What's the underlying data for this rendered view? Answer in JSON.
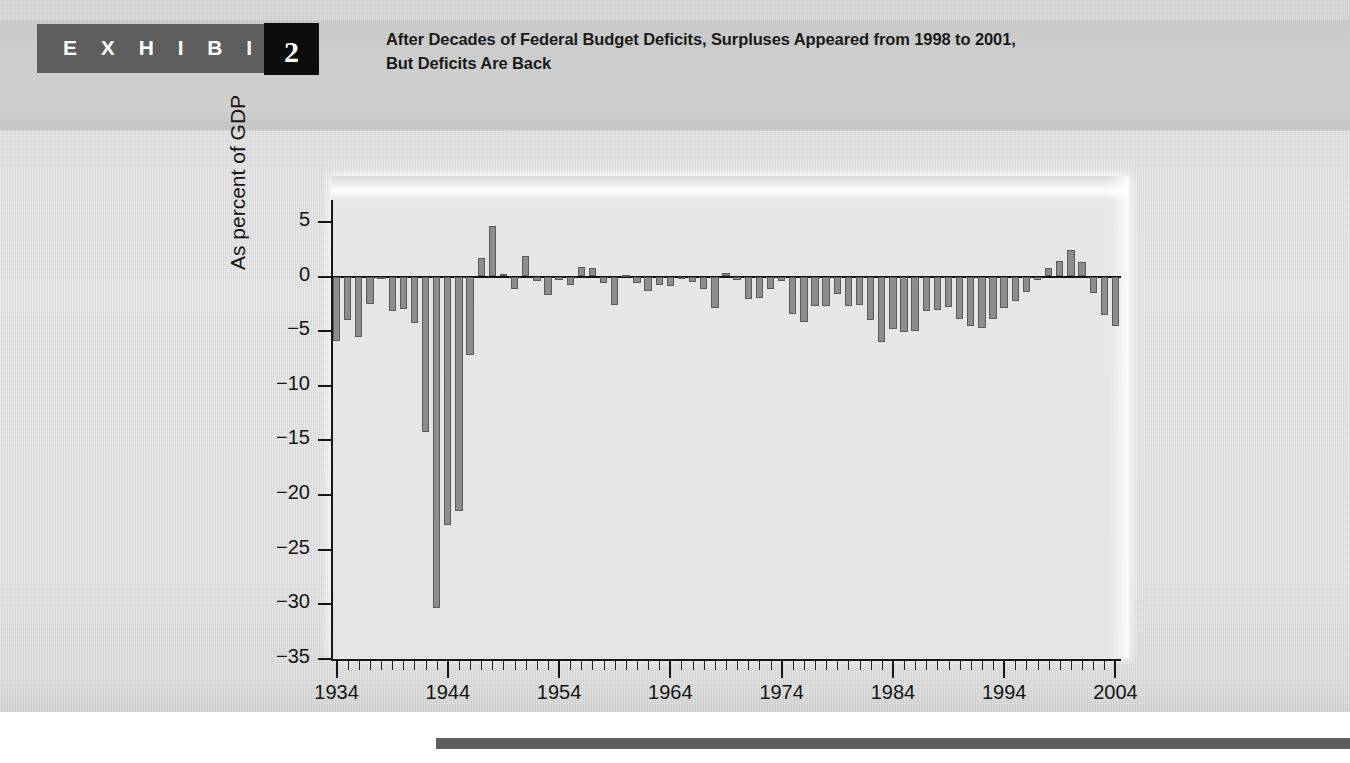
{
  "exhibit": {
    "label": "E X H I B I T",
    "number": "2",
    "title_line1": "After Decades of Federal Budget Deficits, Surpluses Appeared from 1998 to 2001,",
    "title_line2": "But Deficits Are Back"
  },
  "colors": {
    "header_band": "#cfcfcf",
    "exhibit_tab": "#5e5e5e",
    "exhibit_number_box": "#0d0d0d",
    "page_background": "#e0e0e0",
    "panel_background": "#e7e7e7",
    "bar_fill": "#8d8d8d",
    "bar_stroke": "#5a5a5a",
    "axis": "#161616",
    "bottom_rule": "#5d5d5d"
  },
  "chart_data": {
    "type": "bar",
    "title": "After Decades of Federal Budget Deficits, Surpluses Appeared from 1998 to 2001, But Deficits Are Back",
    "xlabel": "",
    "ylabel": "As percent of GDP",
    "ylim": [
      -35,
      7
    ],
    "xlim": [
      1933.5,
      2004.5
    ],
    "grid": false,
    "legend": null,
    "ytick_labels": [
      "5",
      "0",
      "−5",
      "−10",
      "−15",
      "−20",
      "−25",
      "−30",
      "−35"
    ],
    "ytick_values": [
      5,
      0,
      -5,
      -10,
      -15,
      -20,
      -25,
      -30,
      -35
    ],
    "xtick_labels": [
      "1934",
      "1944",
      "1954",
      "1964",
      "1974",
      "1984",
      "1994",
      "2004"
    ],
    "xtick_values": [
      1934,
      1944,
      1954,
      1964,
      1974,
      1984,
      1994,
      2004
    ],
    "minor_tick_step": 1,
    "categories": [
      1934,
      1935,
      1936,
      1937,
      1938,
      1939,
      1940,
      1941,
      1942,
      1943,
      1944,
      1945,
      1946,
      1947,
      1948,
      1949,
      1950,
      1951,
      1952,
      1953,
      1954,
      1955,
      1956,
      1957,
      1958,
      1959,
      1960,
      1961,
      1962,
      1963,
      1964,
      1965,
      1966,
      1967,
      1968,
      1969,
      1970,
      1971,
      1972,
      1973,
      1974,
      1975,
      1976,
      1977,
      1978,
      1979,
      1980,
      1981,
      1982,
      1983,
      1984,
      1985,
      1986,
      1987,
      1988,
      1989,
      1990,
      1991,
      1992,
      1993,
      1994,
      1995,
      1996,
      1997,
      1998,
      1999,
      2000,
      2001,
      2002,
      2003,
      2004
    ],
    "values": [
      -5.9,
      -4.0,
      -5.5,
      -2.5,
      -0.1,
      -3.2,
      -3.0,
      -4.3,
      -14.2,
      -30.3,
      -22.7,
      -21.5,
      -7.2,
      1.7,
      4.6,
      0.2,
      -1.1,
      1.9,
      -0.4,
      -1.7,
      -0.3,
      -0.8,
      0.9,
      0.8,
      -0.6,
      -2.6,
      0.1,
      -0.6,
      -1.3,
      -0.8,
      -0.9,
      -0.2,
      -0.5,
      -1.1,
      -2.9,
      0.3,
      -0.3,
      -2.1,
      -2.0,
      -1.1,
      -0.4,
      -3.4,
      -4.2,
      -2.7,
      -2.7,
      -1.6,
      -2.7,
      -2.6,
      -4.0,
      -6.0,
      -4.8,
      -5.1,
      -5.0,
      -3.2,
      -3.1,
      -2.8,
      -3.9,
      -4.5,
      -4.7,
      -3.9,
      -2.9,
      -2.2,
      -1.4,
      -0.3,
      0.8,
      1.4,
      2.4,
      1.3,
      -1.5,
      -3.5,
      -4.5
    ]
  }
}
